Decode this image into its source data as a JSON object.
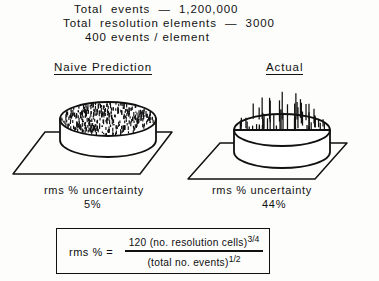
{
  "header": {
    "line1": "Total  events  —  1,200,000",
    "line2": "Total  resolution elements  —  3000",
    "line3": "400 events / element"
  },
  "panels": {
    "left": {
      "title": "Naive Prediction",
      "caption_label": "rms % uncertainty",
      "caption_value": "5%",
      "surface_texture": "stipple",
      "texture_marks": 430
    },
    "right": {
      "title": "Actual",
      "caption_label": "rms % uncertainty",
      "caption_value": "44%",
      "surface_texture": "spikes",
      "spike_count": 54
    }
  },
  "formula": {
    "lhs": "rms %  =",
    "numerator_text": "120 (no. resolution cells)",
    "numerator_exponent": "3/4",
    "denominator_text": "(total  no.  events)",
    "denominator_exponent": "1/2"
  },
  "style": {
    "ink": "#111111",
    "paper": "#fdfdfc"
  },
  "chart_data": {
    "type": "diagram",
    "annotations": [
      "Total events — 1,200,000",
      "Total resolution elements — 3000",
      "400 events/element"
    ],
    "categories": [
      "Naive Prediction",
      "Actual"
    ],
    "values": [
      5,
      44
    ],
    "ylabel": "rms % uncertainty",
    "value_labels": [
      "5%",
      "44%"
    ],
    "equation": "rms % = 120(no. resolution cells)^(3/4) / (total no. events)^(1/2)"
  }
}
